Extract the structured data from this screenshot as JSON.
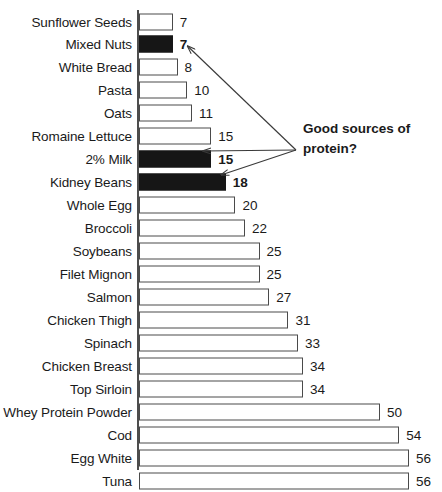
{
  "chart_data": {
    "type": "bar",
    "orientation": "horizontal",
    "title": "",
    "xlabel": "",
    "ylabel": "",
    "grid": false,
    "legend": null,
    "axis_ticks_visible": false,
    "value_labels_shown": true,
    "xlim": [
      0,
      56
    ],
    "categories": [
      "Sunflower Seeds",
      "Mixed Nuts",
      "White Bread",
      "Pasta",
      "Oats",
      "Romaine Lettuce",
      "2% Milk",
      "Kidney Beans",
      "Whole Egg",
      "Broccoli",
      "Soybeans",
      "Filet Mignon",
      "Salmon",
      "Chicken Thigh",
      "Spinach",
      "Chicken Breast",
      "Top Sirloin",
      "Whey Protein Powder",
      "Cod",
      "Egg White",
      "Tuna"
    ],
    "values": [
      7,
      7,
      8,
      10,
      11,
      15,
      15,
      18,
      20,
      22,
      25,
      25,
      27,
      31,
      33,
      34,
      34,
      50,
      54,
      56,
      56
    ],
    "value_label_texts": [
      "7",
      "7",
      "8",
      "10",
      "11",
      "15",
      "15",
      "18",
      "20",
      "22",
      "25",
      "25",
      "27",
      "31",
      "33",
      "34",
      "34",
      "50",
      "54",
      "56",
      "56"
    ],
    "highlighted": [
      false,
      true,
      false,
      false,
      false,
      false,
      true,
      true,
      false,
      false,
      false,
      false,
      false,
      false,
      false,
      false,
      false,
      false,
      false,
      false,
      false
    ],
    "colors": {
      "bar_fill": "#ffffff",
      "bar_border": "#4a4a4a",
      "bar_highlight_fill": "#161616",
      "axis": "#4d4d4d",
      "text": "#1a1a1a",
      "background": "#ffffff"
    },
    "annotations": [
      {
        "name": "good-sources-of-protein",
        "text_line1": "Good sources of",
        "text_line2": "protein?",
        "points_to": [
          "Mixed Nuts",
          "2% Milk",
          "Kidney Beans"
        ]
      }
    ]
  }
}
